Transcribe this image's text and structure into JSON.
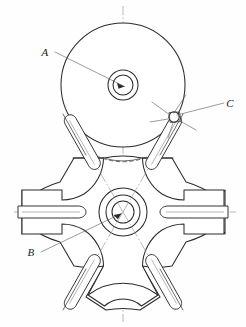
{
  "figure": {
    "kind": "engineering-line-drawing",
    "background_color": "#fefefe",
    "line_color": "#2b2b2b",
    "centerline_color": "#8c8c8c",
    "leader_color": "#5d5d5d",
    "width_px": 246,
    "height_px": 327
  },
  "labels": [
    {
      "id": "A",
      "text": "A",
      "x": 45,
      "y": 55,
      "leader_from": [
        55,
        52
      ],
      "leader_to": [
        126,
        86
      ],
      "points_to": "upper-disc-hub"
    },
    {
      "id": "C",
      "text": "C",
      "x": 228,
      "y": 107,
      "leader_from": [
        224,
        103
      ],
      "leader_to": [
        175,
        116
      ],
      "points_to": "pivot-joint"
    },
    {
      "id": "B",
      "text": "B",
      "x": 31,
      "y": 256,
      "leader_from": [
        41,
        252
      ],
      "leader_to": [
        122,
        213
      ],
      "points_to": "lower-rotor-hub"
    }
  ],
  "components": {
    "upper_disc": {
      "name": "upper-disc",
      "center": [
        123,
        85
      ],
      "radius": 62
    },
    "upper_hub": {
      "name": "upper-disc-hub",
      "center": [
        123,
        85
      ],
      "outer_radius": 15,
      "inner_radius": 10
    },
    "lower_hub": {
      "name": "lower-rotor-hub",
      "center": [
        123,
        212
      ],
      "radii": [
        24,
        17,
        11
      ]
    },
    "lower_rotor": {
      "name": "lower-star-rotor",
      "arm_count": 6,
      "span_x": [
        22,
        225
      ],
      "span_y": [
        158,
        318
      ]
    },
    "pivot_joint": {
      "name": "pivot-joint",
      "center": [
        174,
        117
      ],
      "radius": 5
    },
    "hidden_arc": {
      "name": "hidden-clearance-arc",
      "style": "dashed"
    }
  },
  "vanes": [
    {
      "name": "vane-upper-left"
    },
    {
      "name": "vane-upper-right"
    },
    {
      "name": "vane-left-horizontal"
    },
    {
      "name": "vane-right-horizontal"
    },
    {
      "name": "vane-lower-left"
    },
    {
      "name": "vane-lower-right"
    }
  ],
  "centerlines": {
    "vertical": {
      "name": "vertical-centerline",
      "x": 123
    },
    "horizontal_upper": {
      "name": "upper-horizontal-centerline",
      "y": 85
    },
    "horizontal_lower": {
      "name": "lower-horizontal-centerline",
      "y": 212
    }
  }
}
